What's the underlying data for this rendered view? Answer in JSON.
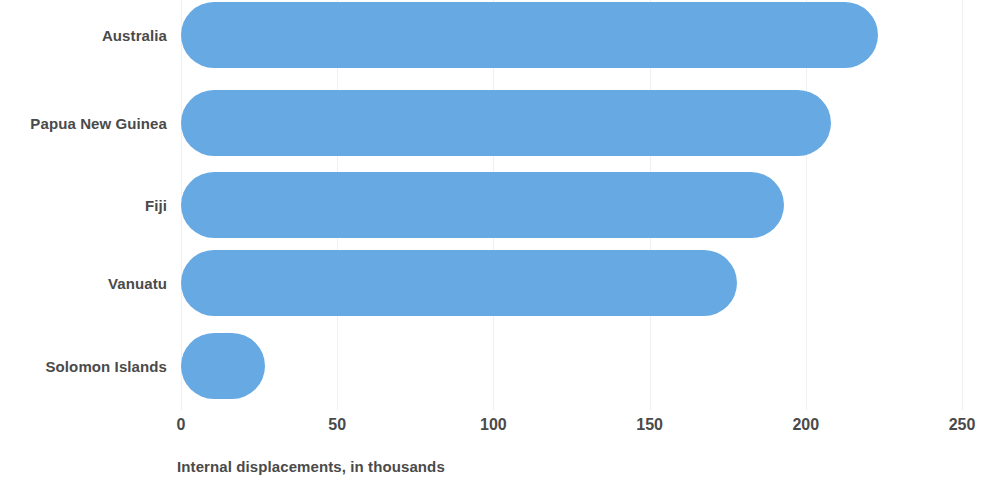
{
  "chart_data": {
    "type": "bar",
    "orientation": "horizontal",
    "title": "",
    "subtitle": "",
    "xlabel": "Internal displacements, in thousands",
    "ylabel": "",
    "categories": [
      "Australia",
      "Papua New Guinea",
      "Fiji",
      "Vanuatu",
      "Solomon Islands"
    ],
    "values": [
      223,
      208,
      193,
      178,
      27
    ],
    "series": [
      {
        "name": "Internal displacements",
        "values": [
          223,
          208,
          193,
          178,
          27
        ]
      }
    ],
    "xlim": [
      0,
      250
    ],
    "xticks": [
      0,
      50,
      100,
      150,
      200,
      250
    ],
    "xtick_labels": [
      "0",
      "50",
      "100",
      "150",
      "200",
      "250"
    ],
    "grid": true,
    "grid_axis": "x",
    "legend": false,
    "legend_position": "none",
    "bar_color": "#66a9e3",
    "bar_corner_style": "rounded",
    "label_color": "#4a4a4a",
    "background_color": "#ffffff",
    "gridline_color": "#eef0f2"
  }
}
